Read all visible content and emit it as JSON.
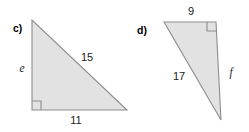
{
  "figure": {
    "background_color": "#ffffff",
    "fill_color": "#e2e2e2",
    "stroke_color": "#8d8d8d",
    "text_color": "#1a1a1a",
    "items": [
      {
        "part_label": "c)",
        "shape": "right-triangle",
        "right_angle_vertex": "bottom-left",
        "sides": {
          "vertical_leg": "e",
          "horizontal_leg": "11",
          "hypotenuse": "15"
        }
      },
      {
        "part_label": "d)",
        "shape": "right-triangle",
        "right_angle_vertex": "top-right",
        "sides": {
          "top_leg": "9",
          "vertical_leg": "f",
          "hypotenuse": "17"
        }
      }
    ]
  }
}
